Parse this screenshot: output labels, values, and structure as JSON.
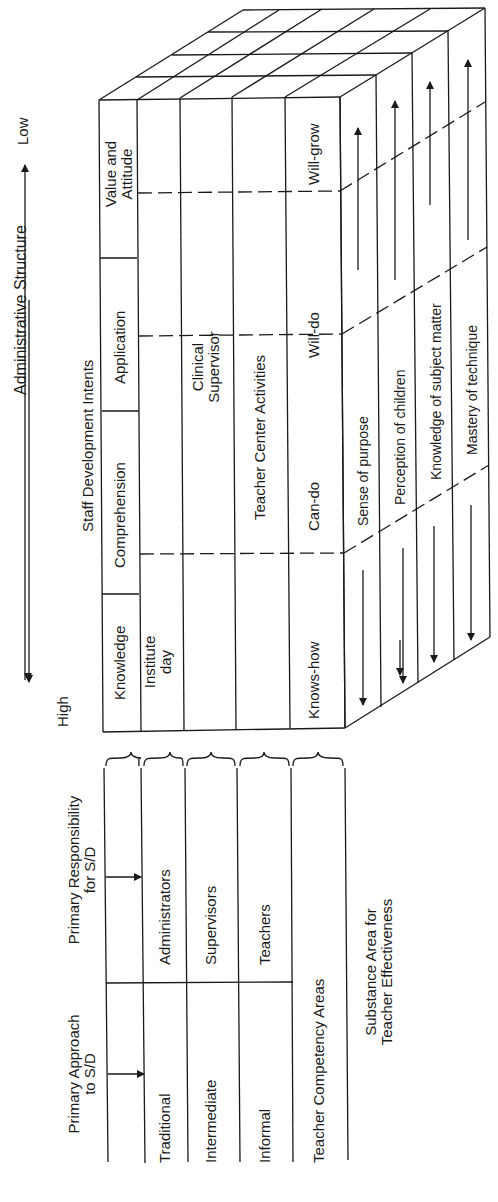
{
  "axis": {
    "title": "Administrative Structure",
    "low": "Low",
    "high": "High"
  },
  "intents": {
    "title": "Staff Development Intents",
    "columns": [
      "Knowledge",
      "Comprehension",
      "Application",
      "Value and Attitude"
    ],
    "value_line1": "Value and",
    "value_line2": "Attitude"
  },
  "cube_rows": {
    "row1": {
      "cells": [
        "Institute day",
        "",
        "",
        ""
      ],
      "institute_line1": "Institute",
      "institute_line2": "day"
    },
    "row2": {
      "clinical_line1": "Clinical",
      "clinical_line2": "Supervisor"
    },
    "row3": {
      "label": "Teacher Center Activities"
    },
    "row4": {
      "cells": [
        "Knows-how",
        "Can-do",
        "Will-do",
        "Will-grow"
      ]
    }
  },
  "competency_areas": [
    "Sense of purpose",
    "Perception of children",
    "Knowledge of subject matter",
    "Mastery of technique"
  ],
  "left_table": {
    "approach_header_line1": "Primary Approach",
    "approach_header_line2": "to S/D",
    "responsibility_header_line1": "Primary Responsibility",
    "responsibility_header_line2": "for S/D",
    "rows": [
      {
        "approach": "Traditional",
        "responsibility": "Administrators"
      },
      {
        "approach": "Intermediate",
        "responsibility": "Supervisors"
      },
      {
        "approach": "Informal",
        "responsibility": "Teachers"
      }
    ],
    "competency_label": "Teacher Competency Areas",
    "substance_line1": "Substance Area for",
    "substance_line2": "Teacher Effectiveness"
  },
  "colors": {
    "ink": "#1a1a1a",
    "background": "#ffffff"
  }
}
